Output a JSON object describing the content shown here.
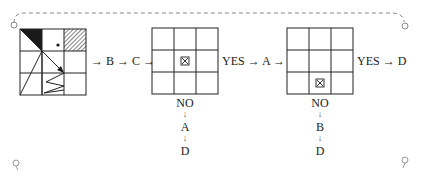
{
  "diagram": {
    "type": "flowchart-puzzle",
    "start_grid": {
      "rows": 3,
      "cols": 3,
      "features": [
        "black-triangle-top-left",
        "dot-center-top",
        "hatched-top-right",
        "arrow-from-center-to-grid",
        "zigzag-bottom-middle",
        "diagonal-lines"
      ]
    },
    "main_flow": {
      "steps_1": [
        "→",
        "B",
        "→",
        "C",
        "→"
      ],
      "label_1": "→ B → C →",
      "grid2": {
        "rows": 3,
        "cols": 3,
        "marker_cell": [
          1,
          1
        ],
        "marker": "⊠"
      },
      "yes_1": "YES → A →",
      "grid3": {
        "rows": 3,
        "cols": 3,
        "marker_cell": [
          2,
          1
        ],
        "marker": "⊠"
      },
      "yes_2": "YES → D"
    },
    "branch_1": {
      "no": "NO",
      "arrow1": "↓",
      "step1": "A",
      "arrow2": "↓",
      "step2": "D"
    },
    "branch_2": {
      "no": "NO",
      "arrow1": "↓",
      "step1": "B",
      "arrow2": "↓",
      "step2": "D"
    },
    "colors": {
      "line": "#222222",
      "dashed": "#888888",
      "black_fill": "#1a1a1a"
    }
  }
}
